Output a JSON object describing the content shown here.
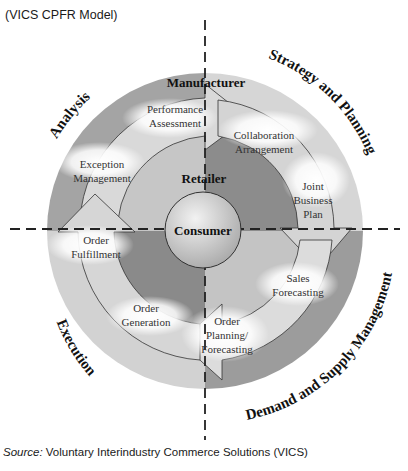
{
  "header": {
    "subtitle": "(VICS CPFR Model)"
  },
  "diagram": {
    "quadrants": {
      "top_left": "Analysis",
      "top_right": "Strategy and Planning",
      "bottom_right": "Demand and Supply Management",
      "bottom_left": "Execution"
    },
    "roles": {
      "outer": "Manufacturer",
      "middle": "Retailer",
      "center": "Consumer"
    },
    "steps": {
      "performance_assessment": [
        "Performance",
        "Assessment"
      ],
      "collaboration_arrangement": [
        "Collaboration",
        "Arrangement"
      ],
      "joint_business_plan": [
        "Joint",
        "Business",
        "Plan"
      ],
      "sales_forecasting": [
        "Sales",
        "Forecasting"
      ],
      "order_planning_forecasting": [
        "Order",
        "Planning/",
        "Forecasting"
      ],
      "order_generation": [
        "Order",
        "Generation"
      ],
      "order_fulfillment": [
        "Order",
        "Fulfillment"
      ],
      "exception_management": [
        "Exception",
        "Management"
      ]
    },
    "colors": {
      "outer_ring_dark": "#9a9a9a",
      "outer_ring_light": "#d4d4d4",
      "inner_dark": "#8e8e8e",
      "inner_light": "#c8c8c8",
      "arrow_fill": "#cfcfcf",
      "consumer_fill": "#d0d0d0"
    }
  },
  "footer": {
    "source_label": "Source:",
    "source_text": " Voluntary Interindustry Commerce Solutions (VICS)"
  }
}
